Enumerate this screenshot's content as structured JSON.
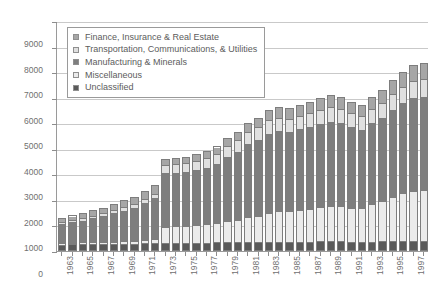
{
  "chart_data": {
    "type": "bar",
    "subtype": "stacked-vertical",
    "title": "",
    "xlabel": "",
    "ylabel": "Number of Firms",
    "ylim": [
      0,
      9000
    ],
    "ytick_step": 1000,
    "yticks": [
      "0",
      "1000",
      "2000",
      "3000",
      "4000",
      "5000",
      "6000",
      "7000",
      "8000",
      "9000"
    ],
    "grid": true,
    "legend_position": "top-left-inside",
    "categories": [
      "1963",
      "1964",
      "1965",
      "1966",
      "1967",
      "1968",
      "1969",
      "1970",
      "1971",
      "1972",
      "1973",
      "1974",
      "1975",
      "1976",
      "1977",
      "1978",
      "1979",
      "1980",
      "1981",
      "1982",
      "1983",
      "1984",
      "1985",
      "1986",
      "1987",
      "1988",
      "1989",
      "1990",
      "1991",
      "1992",
      "1993",
      "1994",
      "1995",
      "1996",
      "1997",
      "1998"
    ],
    "xtick_labels_shown": [
      "1963",
      "1965",
      "1967",
      "1969",
      "1971",
      "1973",
      "1975",
      "1977",
      "1979",
      "1981",
      "1983",
      "1985",
      "1987",
      "1989",
      "1991",
      "1993",
      "1995",
      "1997"
    ],
    "series": [
      {
        "name": "Unclassified",
        "color": "#5a5a5a",
        "values": [
          180,
          190,
          195,
          200,
          205,
          210,
          215,
          220,
          230,
          240,
          250,
          250,
          250,
          255,
          255,
          260,
          265,
          270,
          275,
          280,
          285,
          290,
          290,
          295,
          295,
          300,
          300,
          300,
          295,
          290,
          295,
          300,
          305,
          310,
          315,
          320
        ]
      },
      {
        "name": "Miscellaneous",
        "color": "#ebebeb",
        "values": [
          60,
          70,
          75,
          80,
          90,
          95,
          100,
          110,
          130,
          150,
          640,
          660,
          680,
          700,
          740,
          780,
          850,
          900,
          1000,
          1050,
          1150,
          1200,
          1200,
          1250,
          1300,
          1350,
          1400,
          1400,
          1350,
          1350,
          1500,
          1600,
          1750,
          1900,
          2000,
          2000
        ]
      },
      {
        "name": "Manufacturing & Minerals",
        "color": "#7e7e7e",
        "values": [
          800,
          850,
          900,
          980,
          1050,
          1150,
          1250,
          1350,
          1500,
          1650,
          2150,
          2150,
          2150,
          2200,
          2250,
          2350,
          2550,
          2700,
          2900,
          3000,
          3150,
          3200,
          3150,
          3200,
          3250,
          3300,
          3350,
          3300,
          3200,
          3100,
          3200,
          3300,
          3450,
          3550,
          3650,
          3700
        ]
      },
      {
        "name": "Transportation, Communications, & Utilities",
        "color": "#e0e0e0",
        "values": [
          90,
          100,
          105,
          115,
          125,
          135,
          145,
          160,
          180,
          200,
          330,
          340,
          350,
          360,
          380,
          400,
          430,
          450,
          480,
          500,
          520,
          530,
          530,
          540,
          550,
          560,
          570,
          560,
          540,
          530,
          560,
          590,
          620,
          650,
          680,
          700
        ]
      },
      {
        "name": "Finance, Insurance & Real Estate",
        "color": "#a6a6a6",
        "values": [
          170,
          180,
          195,
          215,
          230,
          250,
          270,
          290,
          320,
          350,
          240,
          250,
          260,
          270,
          290,
          300,
          320,
          340,
          370,
          390,
          420,
          430,
          430,
          440,
          450,
          470,
          480,
          480,
          460,
          450,
          480,
          520,
          560,
          600,
          630,
          650
        ]
      }
    ],
    "totals": [
      1300,
      1390,
      1470,
      1590,
      1700,
      1840,
      1980,
      2130,
      2360,
      2590,
      3610,
      3650,
      3690,
      3785,
      3915,
      4090,
      4415,
      4660,
      5025,
      5220,
      5525,
      5650,
      5600,
      5725,
      5845,
      5980,
      6100,
      6040,
      5845,
      5720,
      6035,
      6310,
      6685,
      7010,
      7275,
      7370
    ]
  },
  "legend": {
    "items": [
      {
        "label": "Finance, Insurance & Real Estate",
        "color": "#a6a6a6"
      },
      {
        "label": "Transportation, Communications, & Utilities",
        "color": "#e0e0e0"
      },
      {
        "label": "Manufacturing & Minerals",
        "color": "#7e7e7e"
      },
      {
        "label": "Miscellaneous",
        "color": "#ebebeb"
      },
      {
        "label": "Unclassified",
        "color": "#5a5a5a"
      }
    ]
  }
}
